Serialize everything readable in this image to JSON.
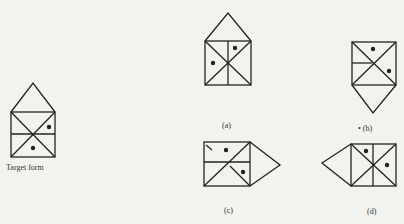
{
  "figure": {
    "target_label": "Target form",
    "options": [
      {
        "id": "a",
        "label": "(a)"
      },
      {
        "id": "b",
        "label": "• (b)"
      },
      {
        "id": "c",
        "label": "(c)"
      },
      {
        "id": "d",
        "label": "(d)"
      }
    ]
  },
  "colors": {
    "stroke": "#222222",
    "background": "#f2f2ef"
  }
}
